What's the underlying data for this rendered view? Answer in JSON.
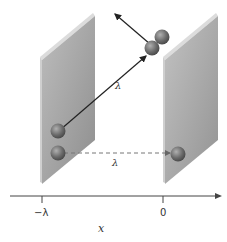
{
  "diagram": {
    "type": "physics-schematic",
    "labels": {
      "diagonal_distance": "λ",
      "horizontal_distance": "λ",
      "axis_label": "x"
    },
    "axis": {
      "ticks": [
        {
          "label": "−λ",
          "position": "left-plate"
        },
        {
          "label": "0",
          "position": "right-plate"
        }
      ]
    },
    "colors": {
      "plate_face": "#a9a9a9",
      "plate_edge": "#d4d4d4",
      "ball": "#6b6b6b",
      "line": "#222222",
      "dashed": "#777777"
    }
  }
}
